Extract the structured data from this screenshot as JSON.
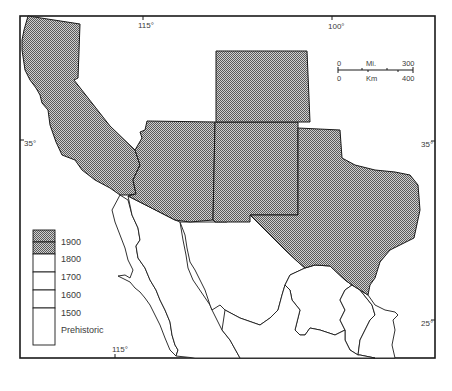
{
  "map": {
    "type": "historical-thematic-map",
    "region": "Southwestern United States and Northern Mexico",
    "colors": {
      "hatched_fill": "#9a9a9a",
      "hatch_dark": "#5a5a5a",
      "hatch_light": "#d0d0d0",
      "border": "#1a1a1a",
      "background": "#ffffff"
    },
    "shaded_regions": [
      {
        "name": "California",
        "period": "1900"
      },
      {
        "name": "Arizona",
        "period": "1900"
      },
      {
        "name": "New Mexico",
        "period": "1900"
      },
      {
        "name": "Colorado",
        "period": "1900"
      },
      {
        "name": "Texas",
        "period": "1900"
      }
    ],
    "unshaded_regions": [
      {
        "name": "Baja California"
      },
      {
        "name": "Sonora"
      },
      {
        "name": "Chihuahua"
      },
      {
        "name": "Coahuila"
      },
      {
        "name": "Nuevo Leon"
      },
      {
        "name": "Tamaulipas"
      },
      {
        "name": "Sinaloa"
      },
      {
        "name": "Durango"
      }
    ]
  },
  "coordinates": {
    "top": [
      {
        "label": "115°"
      },
      {
        "label": "100°"
      }
    ],
    "bottom": [
      {
        "label": "115°"
      }
    ],
    "left": [
      {
        "label": "35°"
      }
    ],
    "right": [
      {
        "label": "35°"
      },
      {
        "label": "25°"
      }
    ]
  },
  "scale_bar": {
    "miles_start": "0",
    "miles_unit": "Mi.",
    "miles_end": "300",
    "km_start": "0",
    "km_unit": "Km",
    "km_end": "400"
  },
  "legend": {
    "items": [
      {
        "label": "1900",
        "filled": true
      },
      {
        "label": "1800",
        "filled": false
      },
      {
        "label": "1700",
        "filled": false
      },
      {
        "label": "1600",
        "filled": false
      },
      {
        "label": "1500",
        "filled": false
      },
      {
        "label": "Prehistoric",
        "filled": false
      }
    ]
  }
}
